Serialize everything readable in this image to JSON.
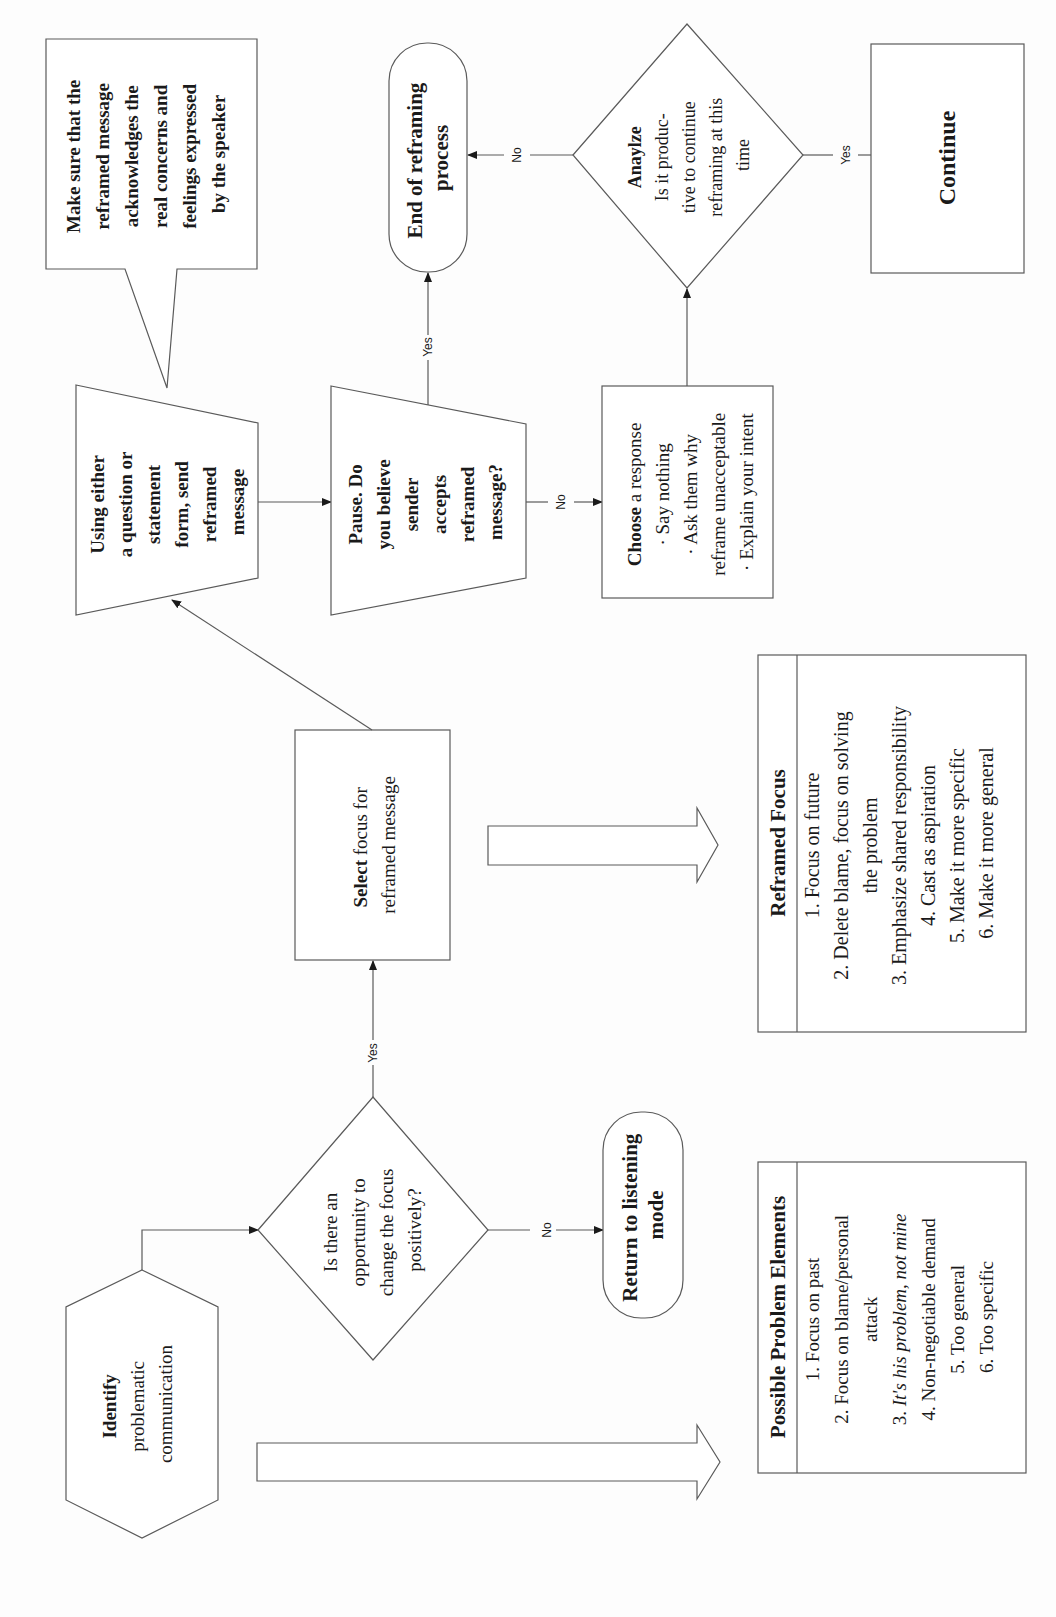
{
  "diagram": {
    "orientation": "rotated-90-ccw",
    "nodes": {
      "identify": {
        "bold": "Identify",
        "lines": [
          "problematic",
          "communication"
        ]
      },
      "opportunity": {
        "lines": [
          "Is there an",
          "opportunity to",
          "change the focus",
          "positively?"
        ]
      },
      "return_listening": {
        "lines": [
          "Return to listening",
          "mode"
        ]
      },
      "select_focus": {
        "bold": "Select",
        "lines": [
          "Select focus for",
          "reframed message"
        ],
        "line1_rest": " focus for"
      },
      "send": {
        "lines": [
          "Using either",
          "a question or",
          "statement",
          "form, ",
          "reframed",
          "message"
        ],
        "bold_word": "send"
      },
      "callout": {
        "lines": [
          "Make sure that the",
          "reframed message",
          "acknowledges the",
          "real concerns and",
          "feelings expressed",
          "by the speaker"
        ]
      },
      "pause": {
        "bold": "Pause.",
        "lines": [
          " Do",
          "you believe",
          "sender",
          "accepts",
          "reframed",
          "message?"
        ]
      },
      "choose": {
        "bold": "Choose",
        "lines": [
          " a response",
          "· Say nothing",
          "· Ask them why",
          "reframe unacceptable",
          "· Explain your intent"
        ]
      },
      "analyze": {
        "bold": "Anaylze",
        "lines": [
          "Is it produc-",
          "tive to continue",
          "reframing at this",
          "time"
        ]
      },
      "end": {
        "lines": [
          "End of reframing",
          "process"
        ]
      },
      "continue": {
        "label": "Continue"
      }
    },
    "edge_labels": {
      "yes_opportunity": "Yes",
      "no_opportunity": "No",
      "yes_pause": "Yes",
      "no_pause": "No",
      "no_analyze": "No",
      "yes_analyze": "Yes"
    },
    "problem_elements": {
      "title": "Possible Problem Elements",
      "items": [
        "1. Focus on past",
        "2. Focus on blame/personal",
        "attack",
        "3. ",
        "It's his problem, not mine",
        "4.  Non-negotiable demand",
        "5. Too general",
        "6.  Too specific"
      ]
    },
    "reframed_focus": {
      "title": "Reframed Focus",
      "items": [
        "1. Focus on future",
        "2. Delete blame, focus on solving",
        "the problem",
        "3.  Emphasize shared responsibility",
        "4. Cast as aspiration",
        "5. Make it more specific",
        "6. Make it more general"
      ]
    }
  }
}
